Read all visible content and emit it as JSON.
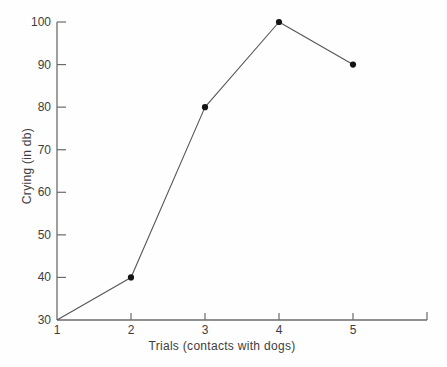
{
  "figure": {
    "background_color": "#fefefe",
    "axis_color": "#6b6b6b",
    "line_color": "#555555",
    "marker_color": "#141414",
    "text_color": "#3d3d3d"
  },
  "chart_data": {
    "type": "line",
    "title": "",
    "xlabel": "Trials (contacts with dogs)",
    "ylabel": "Crying (in db)",
    "x": [
      1,
      2,
      3,
      4,
      5
    ],
    "values": [
      30,
      40,
      80,
      100,
      90
    ],
    "series_name": "crying-level",
    "xticks": [
      1,
      2,
      3,
      4,
      5
    ],
    "yticks": [
      30,
      40,
      50,
      60,
      70,
      80,
      90,
      100
    ],
    "xlim": [
      1,
      6
    ],
    "ylim": [
      30,
      100
    ],
    "grid": false,
    "legend": null,
    "marker": "filled-circle",
    "marker_points": [
      2,
      3,
      4,
      5
    ],
    "x_axis_end_tick": true
  }
}
